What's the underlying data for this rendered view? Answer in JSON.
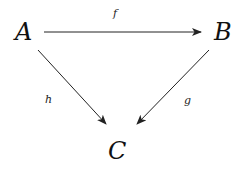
{
  "diagram": {
    "type": "commutative-diagram",
    "nodes": [
      {
        "id": "A",
        "label": "A"
      },
      {
        "id": "B",
        "label": "B"
      },
      {
        "id": "C",
        "label": "C"
      }
    ],
    "edges": [
      {
        "from": "A",
        "to": "B",
        "label": "f"
      },
      {
        "from": "A",
        "to": "C",
        "label": "h"
      },
      {
        "from": "B",
        "to": "C",
        "label": "g"
      }
    ],
    "colors": {
      "stroke": "#222222",
      "text": "#111111"
    }
  }
}
